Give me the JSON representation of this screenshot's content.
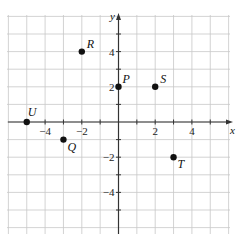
{
  "diagram": {
    "type": "coordinate-plane",
    "axes": {
      "x_label": "x",
      "y_label": "y",
      "x_range": [
        -6,
        6
      ],
      "y_range": [
        -6,
        6
      ]
    },
    "x_tick_labels": [
      {
        "value": -4,
        "text": "−4"
      },
      {
        "value": -2,
        "text": "−2"
      },
      {
        "value": 2,
        "text": "2"
      },
      {
        "value": 4,
        "text": "4"
      }
    ],
    "y_tick_labels": [
      {
        "value": 4,
        "text": "4"
      },
      {
        "value": 2,
        "text": "2"
      },
      {
        "value": -2,
        "text": "−2"
      },
      {
        "value": -4,
        "text": "−4"
      }
    ],
    "points": [
      {
        "label": "P",
        "x": 0,
        "y": 2
      },
      {
        "label": "R",
        "x": -2,
        "y": 4
      },
      {
        "label": "S",
        "x": 2,
        "y": 2
      },
      {
        "label": "U",
        "x": -5,
        "y": 0
      },
      {
        "label": "Q",
        "x": -3,
        "y": -1
      },
      {
        "label": "T",
        "x": 3,
        "y": -2
      }
    ]
  }
}
